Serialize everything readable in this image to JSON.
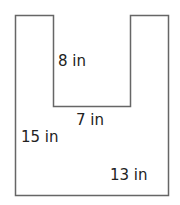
{
  "diagram": {
    "shape": "U-shaped polygon (rectangle with rectangular notch cut from top)",
    "stroke_color": "#666666",
    "labels": {
      "notch_height": "8 in",
      "notch_width": "7 in",
      "outer_height": "15 in",
      "outer_width": "13 in"
    }
  }
}
